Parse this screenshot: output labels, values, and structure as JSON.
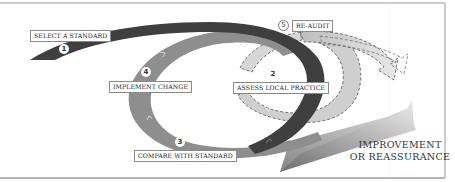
{
  "diagram": {
    "type": "audit-cycle",
    "steps": [
      {
        "number": "1",
        "label": "SELECT A STANDARD"
      },
      {
        "number": "2",
        "label": "ASSESS LOCAL PRACTICE"
      },
      {
        "number": "3",
        "label": "COMPARE WITH STANDARD"
      },
      {
        "number": "4",
        "label": "IMPLEMENT CHANGE"
      },
      {
        "number": "5",
        "label": "RE-AUDIT"
      }
    ],
    "outcome": {
      "line1": "IMPROVEMENT",
      "line2": "OR REASSURANCE"
    },
    "colors": {
      "dark_band": "#3f3f3f",
      "mid_band": "#8c8c8c",
      "light_band": "#c8c8c8",
      "arrow": "#a0a0a0",
      "frame": "#888888"
    }
  }
}
